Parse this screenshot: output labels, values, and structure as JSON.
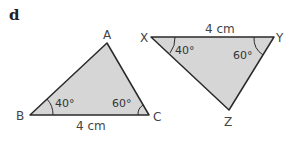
{
  "part_label": "d",
  "colors": {
    "fill": "#d6d6d6",
    "stroke": "#2a2a2a",
    "text": "#444444"
  },
  "triangle_abc": {
    "vertices": {
      "A": "A",
      "B": "B",
      "C": "C"
    },
    "angle_b": "40°",
    "angle_c": "60°",
    "side_bc": "4 cm"
  },
  "triangle_xyz": {
    "vertices": {
      "X": "X",
      "Y": "Y",
      "Z": "Z"
    },
    "angle_x": "40°",
    "angle_y": "60°",
    "side_xy": "4 cm"
  }
}
